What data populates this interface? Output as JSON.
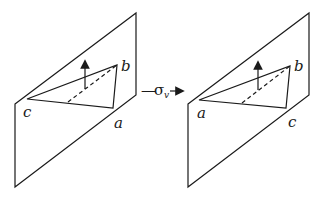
{
  "diagram": {
    "type": "symmetry-operation",
    "operation": {
      "symbol": "σ",
      "subscript": "v",
      "prefix": "—",
      "arrow": "→"
    },
    "before": {
      "vertex_labels": {
        "left": "c",
        "top_right": "b",
        "bottom_right": "a"
      }
    },
    "after": {
      "vertex_labels": {
        "left": "a",
        "top_right": "b",
        "bottom_right": "c"
      }
    },
    "colors": {
      "stroke": "#1a1a1a",
      "background": "#ffffff"
    }
  }
}
